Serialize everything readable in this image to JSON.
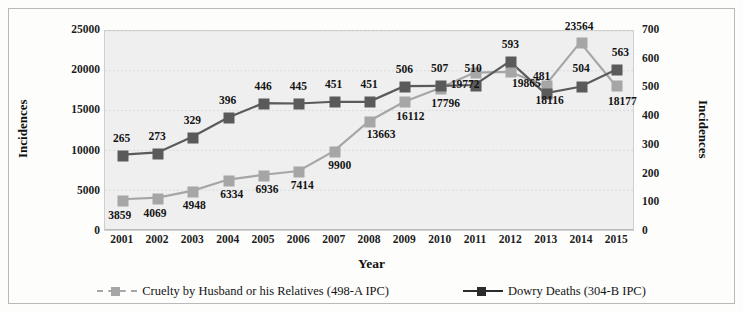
{
  "chart_data": {
    "type": "line",
    "title": "",
    "xlabel": "Year",
    "ylabel": "Incidences",
    "y2label": "Incidences",
    "categories": [
      "2001",
      "2002",
      "2003",
      "2004",
      "2005",
      "2006",
      "2007",
      "2008",
      "2009",
      "2010",
      "2011",
      "2012",
      "2013",
      "2014",
      "2015"
    ],
    "ylim": [
      0,
      25000
    ],
    "y2lim": [
      0,
      700
    ],
    "yticks": [
      "0",
      "5000",
      "10000",
      "15000",
      "20000",
      "25000"
    ],
    "y2ticks": [
      "0",
      "100",
      "200",
      "300",
      "400",
      "500",
      "600",
      "700"
    ],
    "grid": true,
    "legend_position": "bottom",
    "series": [
      {
        "name": "Cruelty by Husband or his Relatives (498-A IPC)",
        "axis": "left",
        "color": "#a6a6a6",
        "marker": "square",
        "values": [
          3859,
          4069,
          4948,
          6334,
          6936,
          7414,
          9900,
          13663,
          16112,
          17796,
          19772,
          19865,
          18116,
          23564,
          18177
        ],
        "labels": [
          "3859",
          "4069",
          "4948",
          "6334",
          "6936",
          "7414",
          "9900",
          "13663",
          "16112",
          "17796",
          "19772",
          "19865",
          "18116",
          "23564",
          "18177"
        ]
      },
      {
        "name": "Dowry Deaths (304-B IPC)",
        "axis": "right",
        "color": "#5a5a5a",
        "marker": "square",
        "values": [
          265,
          273,
          329,
          396,
          446,
          445,
          451,
          451,
          506,
          507,
          510,
          593,
          481,
          504,
          563
        ],
        "labels": [
          "265",
          "273",
          "329",
          "396",
          "446",
          "445",
          "451",
          "451",
          "506",
          "507",
          "510",
          "593",
          "481",
          "504",
          "563"
        ]
      }
    ]
  },
  "legend": {
    "items": [
      {
        "label": "Cruelty by Husband or his Relatives (498-A IPC)",
        "color": "#a6a6a6"
      },
      {
        "label": "Dowry Deaths (304-B IPC)",
        "color": "#2b2b2b"
      }
    ]
  },
  "colors": {
    "plot_background": "#efefef",
    "grid": "#d9d9d9",
    "axis": "#8a8a8a",
    "series_gray": "#a6a6a6",
    "series_black": "#2b2b2b",
    "text": "#141414"
  }
}
